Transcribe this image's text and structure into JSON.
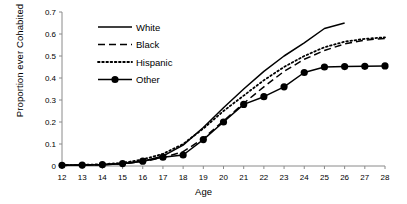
{
  "chart_data": {
    "type": "line",
    "title": "",
    "xlabel": "Age",
    "ylabel": "Proportion ever Cohabited",
    "x": [
      12,
      13,
      14,
      15,
      16,
      17,
      18,
      19,
      20,
      21,
      22,
      23,
      24,
      25,
      26,
      27,
      28
    ],
    "xlim": [
      12,
      28
    ],
    "ylim": [
      0,
      0.7
    ],
    "xticks": [
      "12",
      "13",
      "14",
      "15",
      "16",
      "17",
      "18",
      "19",
      "20",
      "21",
      "22",
      "23",
      "24",
      "25",
      "26",
      "27",
      "28"
    ],
    "yticks": [
      "0",
      "0.1",
      "0.2",
      "0.3",
      "0.4",
      "0.5",
      "0.6",
      "0.7"
    ],
    "ytick_values": [
      0,
      0.1,
      0.2,
      0.3,
      0.4,
      0.5,
      0.6,
      0.7
    ],
    "grid": false,
    "legend_position": "top-center",
    "series": [
      {
        "name": "White",
        "style": "solid",
        "marker": "none",
        "color": "#000000",
        "x": [
          12,
          13,
          14,
          15,
          16,
          17,
          18,
          19,
          20,
          21,
          22,
          23,
          24,
          25,
          26
        ],
        "values": [
          0.003,
          0.004,
          0.006,
          0.01,
          0.022,
          0.045,
          0.095,
          0.175,
          0.265,
          0.35,
          0.43,
          0.5,
          0.56,
          0.625,
          0.65
        ]
      },
      {
        "name": "Black",
        "style": "dashed",
        "marker": "none",
        "color": "#000000",
        "x": [
          12,
          13,
          14,
          15,
          16,
          17,
          18,
          19,
          20,
          21,
          22,
          23,
          24,
          25,
          26,
          27,
          28
        ],
        "values": [
          0.003,
          0.004,
          0.006,
          0.01,
          0.02,
          0.038,
          0.065,
          0.125,
          0.205,
          0.285,
          0.36,
          0.43,
          0.485,
          0.525,
          0.555,
          0.572,
          0.58
        ]
      },
      {
        "name": "Hispanic",
        "style": "dotted",
        "marker": "none",
        "color": "#000000",
        "x": [
          12,
          13,
          14,
          15,
          16,
          17,
          18,
          19,
          20,
          21,
          22,
          23,
          24,
          25,
          26,
          27,
          28
        ],
        "values": [
          0.003,
          0.005,
          0.008,
          0.014,
          0.03,
          0.055,
          0.1,
          0.17,
          0.25,
          0.32,
          0.39,
          0.45,
          0.5,
          0.54,
          0.565,
          0.578,
          0.585
        ]
      },
      {
        "name": "Other",
        "style": "solid",
        "marker": "filled-circle",
        "color": "#000000",
        "x": [
          12,
          13,
          14,
          15,
          16,
          17,
          18,
          19,
          20,
          21,
          22,
          23,
          24,
          25,
          26,
          27,
          28
        ],
        "values": [
          0.003,
          0.004,
          0.006,
          0.011,
          0.022,
          0.04,
          0.05,
          0.12,
          0.2,
          0.28,
          0.315,
          0.36,
          0.425,
          0.45,
          0.452,
          0.453,
          0.455
        ]
      }
    ]
  }
}
